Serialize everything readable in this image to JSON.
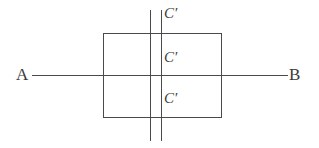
{
  "figure": {
    "width": 319,
    "height": 148,
    "background_color": "#ffffff",
    "line_color": "#4a4a4a",
    "line_width": 1
  },
  "terminals": {
    "left": {
      "label": "A",
      "x": 17,
      "y": 75
    },
    "right": {
      "label": "B",
      "x": 290,
      "y": 75
    }
  },
  "wires": {
    "main_horizontal": {
      "x1": 32,
      "y1": 75,
      "x2": 288,
      "y2": 75
    },
    "rectangle": {
      "left": 103,
      "right": 221,
      "top": 33,
      "bottom": 117
    }
  },
  "components": [
    {
      "type": "capacitor",
      "name": "capacitor-top",
      "label": "C",
      "prime": "′",
      "branch": "top",
      "plate_left_x": 150,
      "plate_right_x": 161,
      "plate_top_y": 10,
      "plate_bottom_y": 56,
      "wire_y": 33
    },
    {
      "type": "capacitor",
      "name": "capacitor-middle",
      "label": "C",
      "prime": "′",
      "branch": "middle",
      "plate_left_x": 150,
      "plate_right_x": 161,
      "plate_top_y": 54,
      "plate_bottom_y": 97,
      "wire_y": 75
    },
    {
      "type": "capacitor",
      "name": "capacitor-bottom",
      "label": "C",
      "prime": "′",
      "branch": "bottom",
      "plate_left_x": 150,
      "plate_right_x": 161,
      "plate_top_y": 96,
      "plate_bottom_y": 141,
      "wire_y": 117
    }
  ]
}
